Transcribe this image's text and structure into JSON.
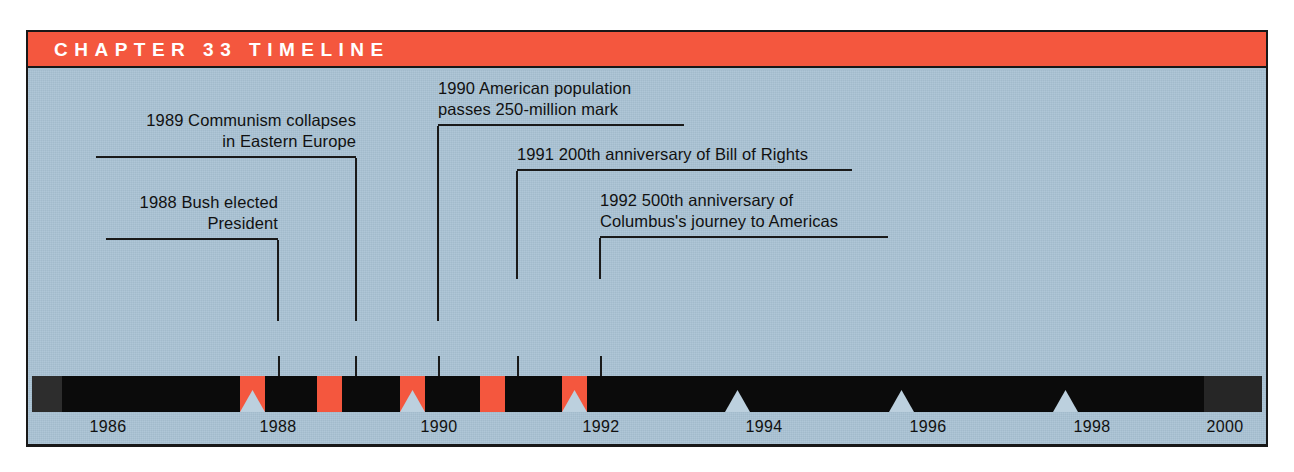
{
  "figure": {
    "header_title": "CHAPTER 33 TIMELINE",
    "colors": {
      "accent_red": "#f4573e",
      "background_blue": "#a9c2d4",
      "bar_black": "#0b0b0b",
      "ink": "#1a1a1a",
      "header_text": "#ffffff"
    }
  },
  "callouts": [
    {
      "id": "callout-1989",
      "year": "1989",
      "lines": [
        "1989  Communism collapses",
        "in Eastern Europe"
      ],
      "align": "right",
      "drop": "right"
    },
    {
      "id": "callout-1988",
      "year": "1988",
      "lines": [
        "1988  Bush elected",
        "President"
      ],
      "align": "right",
      "drop": "right"
    },
    {
      "id": "callout-1990",
      "year": "1990",
      "lines": [
        "1990  American population",
        "passes 250-million mark"
      ],
      "align": "left",
      "drop": "left"
    },
    {
      "id": "callout-1991",
      "year": "1991",
      "lines": [
        "1991  200th anniversary of Bill of Rights"
      ],
      "align": "left",
      "drop": "left"
    },
    {
      "id": "callout-1992",
      "year": "1992",
      "lines": [
        "1992  500th anniversary of",
        "Columbus's journey to Americas"
      ],
      "align": "left",
      "drop": "left"
    }
  ],
  "events": [
    {
      "year": "1988",
      "label": "Bush elected President",
      "marked": true
    },
    {
      "year": "1989",
      "label": "Communism collapses in Eastern Europe",
      "marked": false
    },
    {
      "year": "1990",
      "label": "American population passes 250-million mark",
      "marked": true
    },
    {
      "year": "1991",
      "label": "200th anniversary of Bill of Rights",
      "marked": false
    },
    {
      "year": "1992",
      "label": "500th anniversary of Columbus's journey to Americas",
      "marked": true
    }
  ],
  "axis": {
    "years": [
      "1986",
      "1988",
      "1990",
      "1992",
      "1994",
      "1996",
      "1998",
      "2000"
    ],
    "range_start": "1986",
    "range_end": "2000",
    "tick_step": "2"
  },
  "folio": ""
}
